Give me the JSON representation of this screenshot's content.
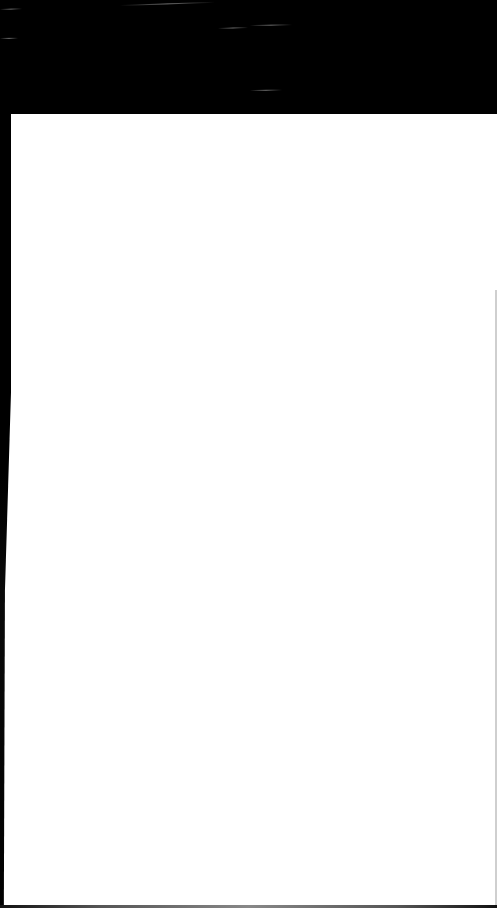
{
  "screen": {
    "state": "blank",
    "header_band_color": "#000000",
    "content_background": "#ffffff"
  },
  "decorations": {
    "streaks": [
      {
        "x": 0,
        "y": 9,
        "w": 22,
        "angle": -2
      },
      {
        "x": 120,
        "y": 5,
        "w": 95,
        "angle": -2
      },
      {
        "x": 250,
        "y": 25,
        "w": 42,
        "angle": -1
      },
      {
        "x": 218,
        "y": 28,
        "w": 30,
        "angle": -2
      },
      {
        "x": 0,
        "y": 38,
        "w": 18,
        "angle": -1
      },
      {
        "x": 250,
        "y": 90,
        "w": 32,
        "angle": -1
      }
    ]
  }
}
